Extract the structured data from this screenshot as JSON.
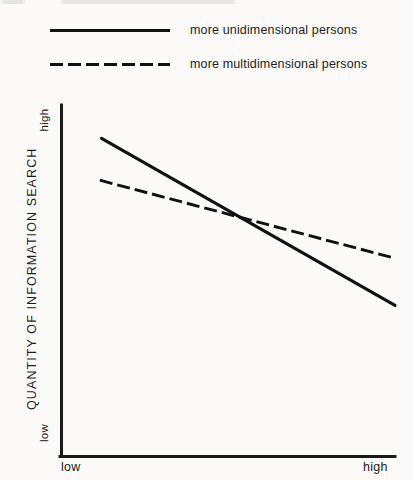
{
  "chart_data": {
    "type": "line",
    "title": "",
    "xlabel": "",
    "ylabel": "QUANTITY OF INFORMATION SEARCH",
    "x_ticklabels": [
      "low",
      "high"
    ],
    "y_ticklabels": [
      "low",
      "high"
    ],
    "xlim": [
      0,
      1
    ],
    "ylim": [
      0,
      1
    ],
    "grid": false,
    "legend_position": "above-plot-left",
    "series": [
      {
        "name": "more unidimensional persons",
        "style": "solid",
        "color": "#111111",
        "x": [
          0.12,
          1.0
        ],
        "values": [
          0.905,
          0.43
        ]
      },
      {
        "name": "more multidimensional persons",
        "style": "dashed",
        "color": "#111111",
        "x": [
          0.115,
          1.0
        ],
        "values": [
          0.786,
          0.564
        ]
      }
    ],
    "annotations": [
      {
        "text": "series cross",
        "x": 0.56,
        "y": 0.678
      }
    ]
  },
  "legend": {
    "items": [
      {
        "label": "more unidimensional persons",
        "style": "solid"
      },
      {
        "label": "more multidimensional persons",
        "style": "dashed"
      }
    ]
  },
  "axes": {
    "y_title": "QUANTITY OF INFORMATION SEARCH",
    "y_high": "high",
    "y_low": "low",
    "x_low": "low",
    "x_high": "high"
  },
  "colors": {
    "ink": "#111111",
    "page": "#fbfaf8"
  }
}
